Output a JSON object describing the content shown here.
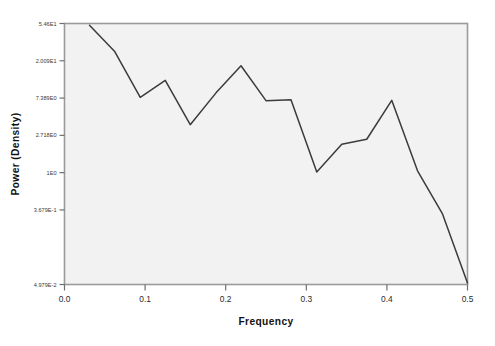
{
  "chart_data": {
    "type": "line",
    "title": "",
    "xlabel": "Frequency",
    "ylabel": "Power (Density)",
    "yscale": "log",
    "grid": false,
    "legend": false,
    "xlim": [
      0.0,
      0.5
    ],
    "ylim": [
      0.0498,
      54.6
    ],
    "xticks": [
      0.0,
      0.1,
      0.2,
      0.3,
      0.4,
      0.5
    ],
    "xticklabels": [
      "0.0",
      "0.1",
      "0.2",
      "0.3",
      "0.4",
      "0.5"
    ],
    "yticks": [
      54.6,
      20.09,
      7.389,
      2.718,
      1.0,
      0.3679,
      0.04979
    ],
    "yticklabels": [
      "5.46E1",
      "2.009E1",
      "7.389E0",
      "2.718E0",
      "1E0",
      "3.679E-1",
      "4.979E-2"
    ],
    "series": [
      {
        "name": "Power (Density)",
        "color": "#3b3b3b",
        "x": [
          0.031,
          0.062,
          0.094,
          0.125,
          0.156,
          0.188,
          0.219,
          0.25,
          0.281,
          0.313,
          0.344,
          0.375,
          0.406,
          0.438,
          0.469,
          0.5
        ],
        "values": [
          52.0,
          26.0,
          7.55,
          11.9,
          3.62,
          8.5,
          17.6,
          6.9,
          7.05,
          1.02,
          2.14,
          2.45,
          6.95,
          1.05,
          0.33,
          0.052
        ]
      }
    ]
  },
  "plot_area": {
    "background_color": "#f2f2f2",
    "border_color": "#9a9a9a",
    "page_background": "#ffffff"
  },
  "axis_labels": {
    "x_title": "Frequency",
    "y_title": "Power (Density)"
  }
}
